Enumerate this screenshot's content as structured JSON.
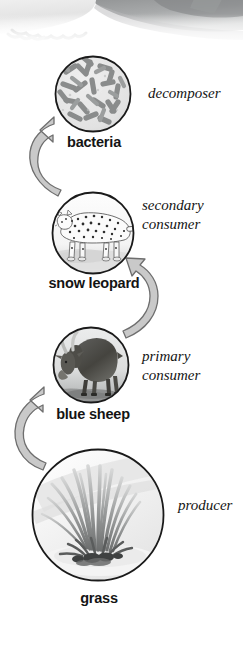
{
  "figure": {
    "type": "food-chain-diagram",
    "title": "",
    "background_color": "#ffffff",
    "ink_color": "#141414",
    "arrow_fill": "#c9c9c9",
    "arrow_stroke": "#6e6e6e",
    "circle_stroke": "#1a1a1a"
  },
  "header_photo": {
    "name": "mountain-rock-photo-fragment",
    "description": "faded grayscale photograph edge at top of page"
  },
  "nodes": [
    {
      "id": "bacteria",
      "caption": "bacteria",
      "role": "decomposer",
      "role_lines": [
        "decomposer"
      ],
      "image_name": "bacteria-micrograph",
      "cx": 93,
      "cy": 94,
      "r": 38
    },
    {
      "id": "snow-leopard",
      "caption": "snow leopard",
      "role": "secondary consumer",
      "role_lines": [
        "secondary",
        "consumer"
      ],
      "image_name": "snow-leopard-photo",
      "cx": 93,
      "cy": 233,
      "r": 41
    },
    {
      "id": "blue-sheep",
      "caption": "blue sheep",
      "role": "primary consumer",
      "role_lines": [
        "primary",
        "consumer"
      ],
      "image_name": "blue-sheep-photo",
      "cx": 91,
      "cy": 365,
      "r": 38
    },
    {
      "id": "grass",
      "caption": "grass",
      "role": "producer",
      "role_lines": [
        "producer"
      ],
      "image_name": "grass-tuft-photo",
      "cx": 98,
      "cy": 515,
      "r": 66
    }
  ],
  "arrows": [
    {
      "id": "grass-to-blue-sheep",
      "name": "arrow-grass-to-blue-sheep",
      "from": "grass",
      "to": "blue-sheep",
      "side": "left",
      "direction": "up"
    },
    {
      "id": "blue-sheep-to-snow-leopard",
      "name": "arrow-blue-sheep-to-snow-leopard",
      "from": "blue-sheep",
      "to": "snow-leopard",
      "side": "right",
      "direction": "up"
    },
    {
      "id": "snow-leopard-to-bacteria",
      "name": "arrow-snow-leopard-to-bacteria",
      "from": "snow-leopard",
      "to": "bacteria",
      "side": "left",
      "direction": "up"
    }
  ]
}
